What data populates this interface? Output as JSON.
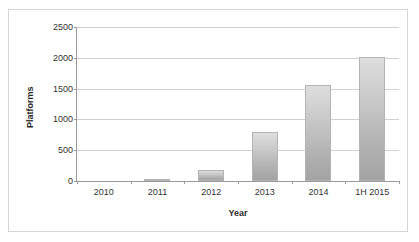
{
  "chart_data": {
    "type": "bar",
    "title": "",
    "subtitle": "",
    "xlabel": "Year",
    "ylabel": "Platforms",
    "categories": [
      "2010",
      "2011",
      "2012",
      "2013",
      "2014",
      "1H 2015"
    ],
    "values": [
      0,
      25,
      180,
      790,
      1560,
      2010
    ],
    "series": [
      {
        "name": "Platforms",
        "values": [
          0,
          25,
          180,
          790,
          1560,
          2010
        ]
      }
    ],
    "ylim": [
      0,
      2500
    ],
    "y_ticks": [
      0,
      500,
      1000,
      1500,
      2000,
      2500
    ],
    "y_tick_labels": [
      "0",
      "500",
      "1000",
      "1500",
      "2000",
      "2500"
    ],
    "grid": "horizontal",
    "legend": "none",
    "bar_color": "#c0c0c0",
    "bar_edge_color": "#b4b4b4",
    "gridline_color": "#cfcfcf",
    "axis_color": "#9a9a9a",
    "frame_color": "#d5d5d5",
    "background": "#ffffff"
  }
}
